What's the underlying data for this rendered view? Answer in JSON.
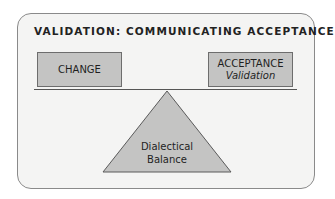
{
  "title": "VALIDATION: COMMUNICATING ACCEPTANCE",
  "left_box": {
    "label": "CHANGE"
  },
  "right_box": {
    "label": "ACCEPTANCE",
    "sublabel": "Validation"
  },
  "fulcrum": {
    "line1": "Dialectical",
    "line2": "Balance"
  },
  "colors": {
    "frame_bg": "#f4f4f3",
    "frame_border": "#8a8a8a",
    "box_fill": "#c4c4c3",
    "triangle_fill": "#c4c4c3",
    "text": "#1f1f1f"
  }
}
